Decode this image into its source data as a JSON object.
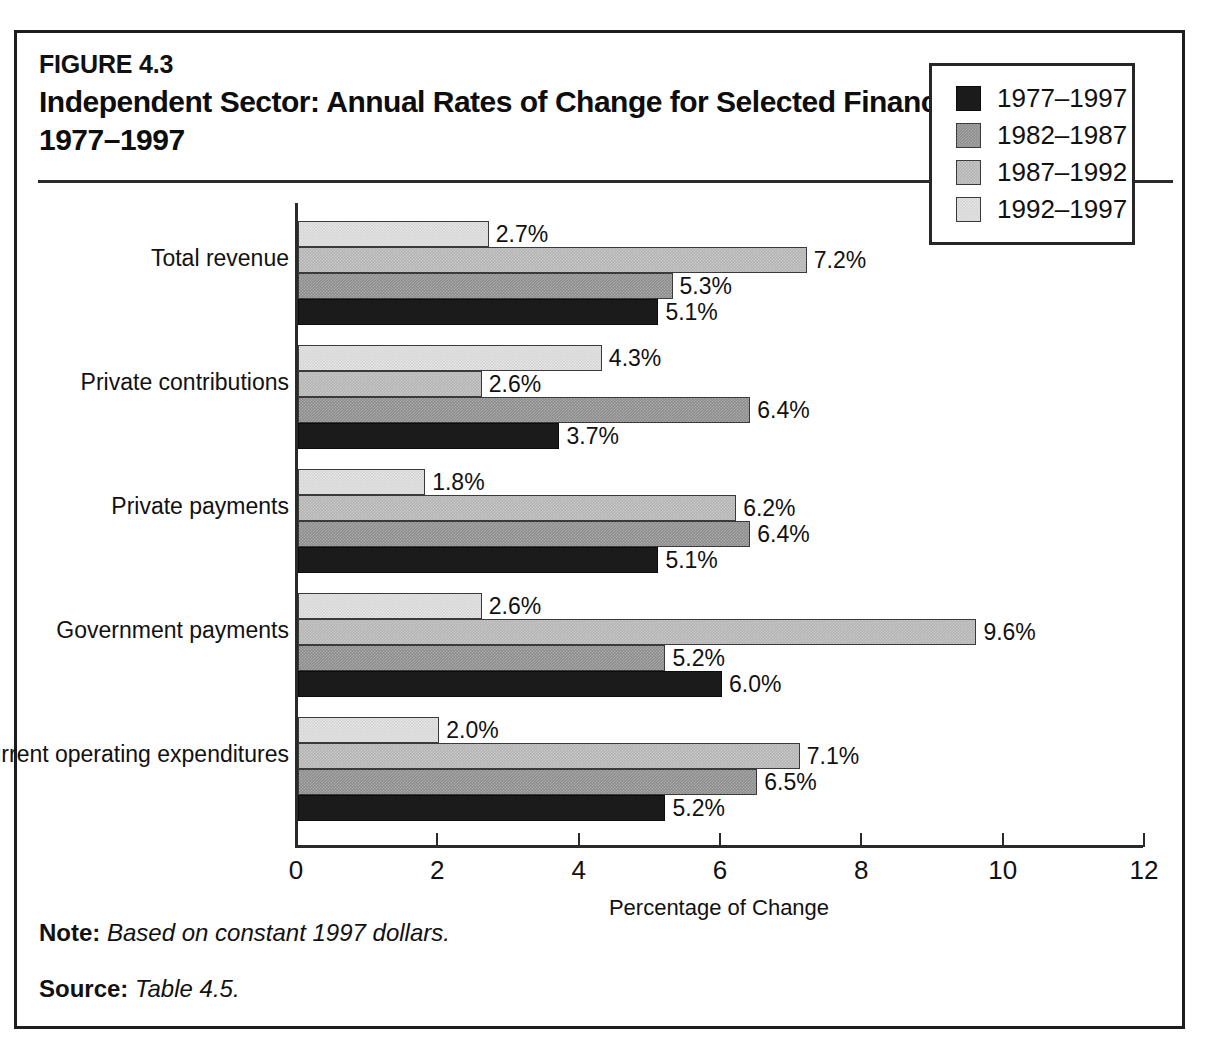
{
  "figure": {
    "number": "FIGURE 4.3",
    "title": "Independent Sector: Annual Rates of Change for Selected Financial Items, 1977–1997"
  },
  "footer": {
    "note_label": "Note:",
    "note_text": "Based on constant 1997 dollars.",
    "source_label": "Source:",
    "source_text": "Table 4.5."
  },
  "legend": {
    "position": "top-right",
    "entries": [
      {
        "label": "1977–1997",
        "color": "#1b1b1b"
      },
      {
        "label": "1982–1987",
        "color": "#8e8e8e"
      },
      {
        "label": "1987–1992",
        "color": "#b4b4b4"
      },
      {
        "label": "1992–1997",
        "color": "#d6d6d6"
      }
    ]
  },
  "chart_data": {
    "type": "bar",
    "orientation": "horizontal",
    "title": "Independent Sector: Annual Rates of Change for Selected Financial Items, 1977–1997",
    "xlabel": "Percentage of Change",
    "ylabel": "",
    "xlim": [
      0,
      12
    ],
    "xticks": [
      0,
      2,
      4,
      6,
      8,
      10,
      12
    ],
    "xtick_labels": [
      "0",
      "2",
      "4",
      "6",
      "8",
      "10",
      "12"
    ],
    "grid": false,
    "value_format": "{v}%",
    "categories": [
      "Total revenue",
      "Private contributions",
      "Private payments",
      "Government payments",
      "Current operating expenditures"
    ],
    "series": [
      {
        "name": "1977–1997",
        "color": "#1b1b1b",
        "values": [
          5.1,
          3.7,
          5.1,
          6.0,
          5.2
        ],
        "labels": [
          "5.1%",
          "3.7%",
          "5.1%",
          "6.0%",
          "5.2%"
        ]
      },
      {
        "name": "1982–1987",
        "color": "#8e8e8e",
        "values": [
          5.3,
          6.4,
          6.4,
          5.2,
          6.5
        ],
        "labels": [
          "5.3%",
          "6.4%",
          "6.4%",
          "5.2%",
          "6.5%"
        ]
      },
      {
        "name": "1987–1992",
        "color": "#b4b4b4",
        "values": [
          7.2,
          2.6,
          6.2,
          9.6,
          7.1
        ],
        "labels": [
          "7.2%",
          "2.6%",
          "6.2%",
          "9.6%",
          "7.1%"
        ]
      },
      {
        "name": "1992–1997",
        "color": "#d6d6d6",
        "values": [
          2.7,
          4.3,
          1.8,
          2.6,
          2.0
        ],
        "labels": [
          "2.7%",
          "4.3%",
          "1.8%",
          "2.6%",
          "2.0%"
        ]
      }
    ]
  }
}
